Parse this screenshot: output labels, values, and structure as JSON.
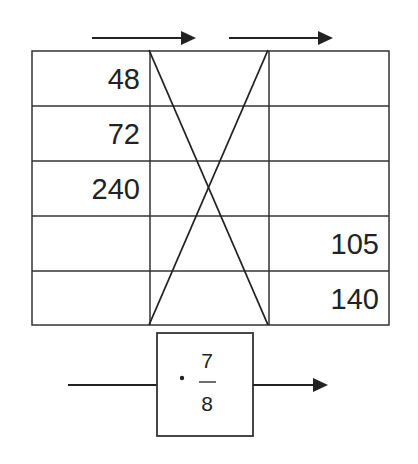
{
  "diagram": {
    "type": "proportion-table",
    "left_column": [
      "48",
      "72",
      "240",
      "",
      ""
    ],
    "middle_column": [
      "",
      "",
      "",
      "",
      ""
    ],
    "right_column": [
      "",
      "",
      "",
      "105",
      "140"
    ],
    "operator": {
      "symbol": "·",
      "numerator": "7",
      "denominator": "8"
    },
    "arrows": [
      "top-left-arrow",
      "top-right-arrow",
      "operator-output-arrow"
    ],
    "colors": {
      "line": "#333333",
      "text": "#222222",
      "background": "#ffffff"
    }
  }
}
